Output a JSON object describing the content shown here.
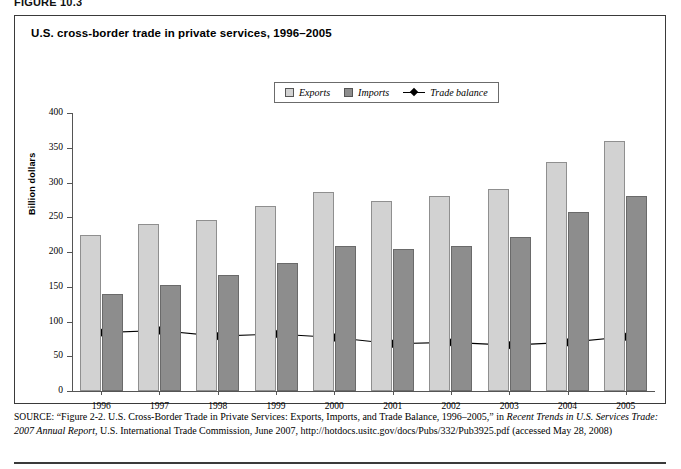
{
  "figure_label": "FIGURE 10.3",
  "chart_title": "U.S. cross-border trade in private services, 1996–2005",
  "legend": {
    "position": "top-center",
    "items": [
      {
        "label": "Exports",
        "marker": "square-swatch",
        "color": "#d2d2d2"
      },
      {
        "label": "Imports",
        "marker": "square-swatch",
        "color": "#8d8d8d"
      },
      {
        "label": "Trade balance",
        "marker": "line-diamond",
        "color": "#000000"
      }
    ]
  },
  "chart_data": {
    "type": "bar",
    "title": "U.S. cross-border trade in private services, 1996–2005",
    "xlabel": "",
    "ylabel": "Billion dollars",
    "ylim": [
      0,
      400
    ],
    "ytick_step": 50,
    "yticks": [
      "400",
      "350",
      "300",
      "250",
      "200",
      "150",
      "100",
      "50",
      "0"
    ],
    "grid": false,
    "legend_position": "top-center",
    "categories": [
      "1996",
      "1997",
      "1998",
      "1999",
      "2000",
      "2001",
      "2002",
      "2003",
      "2004",
      "2005"
    ],
    "series": [
      {
        "name": "Exports",
        "type": "bar",
        "color": "#d2d2d2",
        "values": [
          225,
          240,
          246,
          266,
          286,
          273,
          280,
          291,
          329,
          360
        ]
      },
      {
        "name": "Imports",
        "type": "bar",
        "color": "#8d8d8d",
        "values": [
          140,
          153,
          167,
          184,
          208,
          204,
          209,
          221,
          258,
          281
        ]
      },
      {
        "name": "Trade balance",
        "type": "line",
        "color": "#000000",
        "marker": "diamond",
        "values": [
          84,
          87,
          79,
          82,
          77,
          68,
          70,
          66,
          70,
          78
        ]
      }
    ]
  },
  "source": {
    "label": "SOURCE:",
    "line1_a": " “Figure 2-2. U.S. Cross-Border Trade in Private Services: Exports, Imports, and Trade Balance, 1996–2005,” in ",
    "line1_italic": "Recent Trends in U.S. Services Trade: 2007 Annual Report",
    "line2_b": ", U.S. International Trade Commission, June 2007, http://hotdocs.usitc.gov/docs/Pubs/332/Pub3925.pdf (accessed May 28, 2008)"
  },
  "colors": {
    "exports": "#d2d2d2",
    "imports": "#8d8d8d",
    "line": "#000000",
    "frame": "#3a3a3a",
    "axis": "#555555"
  }
}
